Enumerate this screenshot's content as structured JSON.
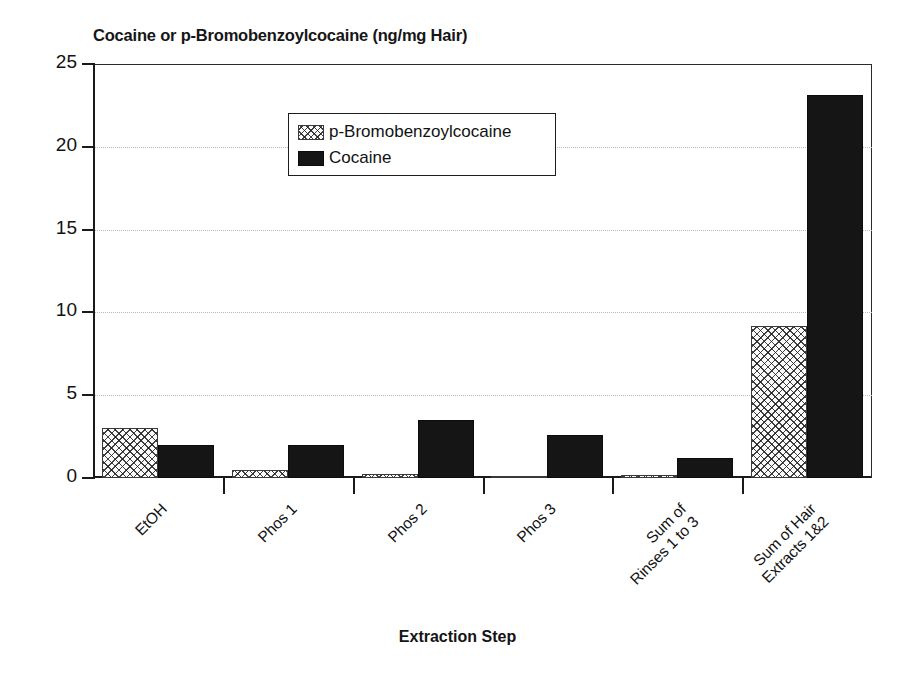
{
  "chart_data": {
    "type": "bar",
    "title": "Cocaine or p-Bromobenzoylcocaine (ng/mg Hair)",
    "xlabel": "Extraction Step",
    "ylabel": "",
    "ylim": [
      0,
      25
    ],
    "yticks": [
      0,
      5,
      10,
      15,
      20,
      25
    ],
    "grid": true,
    "legend_position": "upper-center-left",
    "categories": [
      "EtOH",
      "Phos 1",
      "Phos 2",
      "Phos 3",
      "Sum of\nRinses 1 to 3",
      "Sum of Hair\nExtracts 1&2"
    ],
    "series": [
      {
        "name": "p-Bromobenzoylcocaine",
        "pattern": "crosshatch",
        "values": [
          3.0,
          0.5,
          0.25,
          0.15,
          0.2,
          9.2
        ]
      },
      {
        "name": "Cocaine",
        "pattern": "solid-black",
        "values": [
          2.0,
          2.0,
          3.5,
          2.6,
          1.2,
          23.1
        ]
      }
    ]
  },
  "legend": {
    "items": [
      {
        "label": "p-Bromobenzoylcocaine",
        "swatch": "crosshatch-swatch"
      },
      {
        "label": "Cocaine",
        "swatch": "black-swatch"
      }
    ]
  },
  "colors": {
    "cocaine": "#151515",
    "pbbc_outline": "#3a3a3a",
    "pbbc_fill": "#fbfbfb",
    "axis": "#1a1a1a",
    "grid": "#b9b9b9",
    "text": "#121212",
    "background": "#ffffff"
  },
  "yticklabels": [
    "25",
    "20",
    "15",
    "10",
    "5",
    "0"
  ]
}
